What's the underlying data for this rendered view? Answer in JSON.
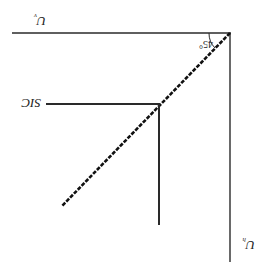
{
  "diagram": {
    "orientation": "rotated 180 degrees",
    "axes": {
      "horizontal": {
        "label": "U",
        "subscript": "v"
      },
      "vertical": {
        "label": "U",
        "subscript": "h"
      }
    },
    "angle_label": "45°",
    "point_label": "SIC",
    "colors": {
      "line": "#2a2a2a",
      "background": "#ffffff"
    }
  }
}
